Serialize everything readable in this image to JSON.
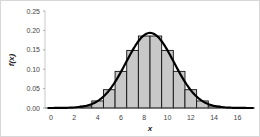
{
  "chart_data": {
    "type": "bar",
    "title": "",
    "xlabel": "x",
    "ylabel": "f(x)",
    "x": [
      0,
      1,
      2,
      3,
      4,
      5,
      6,
      7,
      8,
      9,
      10,
      11,
      12,
      13,
      14,
      15,
      16,
      17
    ],
    "series": [
      {
        "name": "probability bars",
        "type": "bar",
        "values": [
          0.0,
          0.0001,
          0.001,
          0.0052,
          0.0182,
          0.0472,
          0.0944,
          0.1484,
          0.1855,
          0.1855,
          0.1484,
          0.0944,
          0.0472,
          0.0182,
          0.0052,
          0.001,
          0.0001,
          0.0
        ]
      },
      {
        "name": "normal curve",
        "type": "line",
        "values": [
          0.0,
          0.0001,
          0.0009,
          0.0049,
          0.0179,
          0.0472,
          0.0936,
          0.1457,
          0.1846,
          0.1846,
          0.1457,
          0.0936,
          0.0472,
          0.0179,
          0.0049,
          0.0009,
          0.0001,
          0.0
        ]
      }
    ],
    "xticks": [
      "0",
      "2",
      "4",
      "6",
      "8",
      "10",
      "12",
      "14",
      "16"
    ],
    "yticks": [
      "0.00",
      "0.05",
      "0.10",
      "0.15",
      "0.20",
      "0.25"
    ],
    "xlim": [
      -0.5,
      17.5
    ],
    "ylim": [
      0,
      0.25
    ],
    "grid": false,
    "legend": null,
    "colors": {
      "bar_fill": "#c8c8c8",
      "bar_edge": "#111111",
      "curve": "#000000"
    }
  }
}
